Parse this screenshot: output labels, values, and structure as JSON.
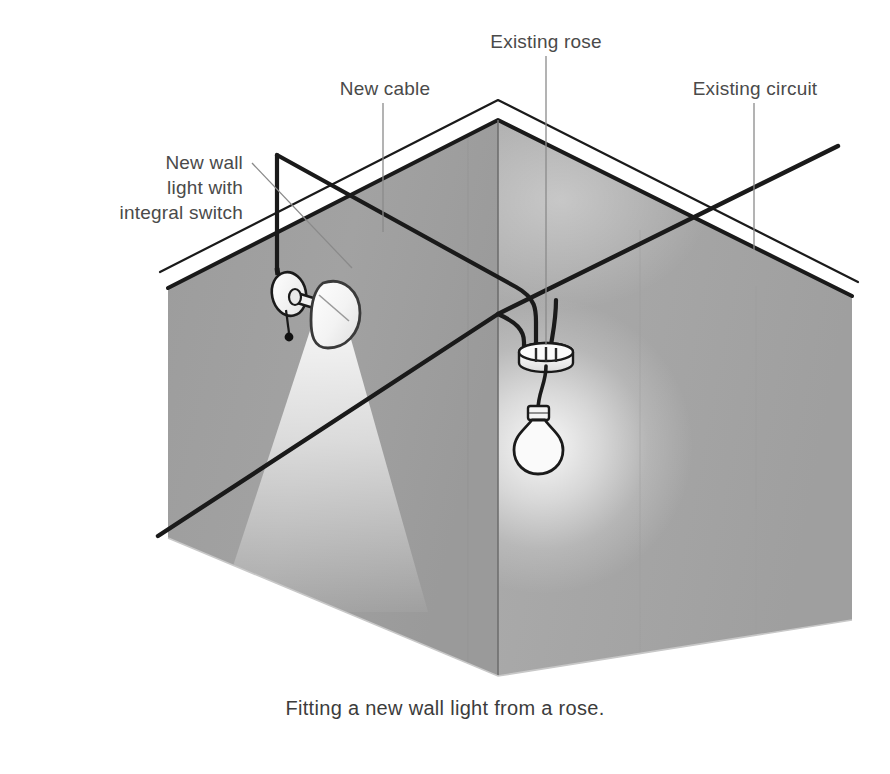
{
  "figure": {
    "caption": "Fitting a new wall light from a rose.",
    "background_color": "#ffffff",
    "label_color": "#4a4a4a",
    "cable_color": "#1a1a1a",
    "leader_color": "#8a8a8a",
    "wall_left_color": "#9e9e9e",
    "wall_right_color": "#a8a8a8",
    "ceiling_color": "#ffffff",
    "floor_color": "#ffffff",
    "outline_color": "#1a1a1a",
    "fixture_fill": "#f2f2f2",
    "glow_color": "#ffffff"
  },
  "labels": [
    {
      "id": "new-wall-light",
      "text": "New wall\nlight with\nintegral switch",
      "align": "right",
      "x": 38,
      "y": 150,
      "width": 205
    },
    {
      "id": "new-cable",
      "text": "New cable",
      "align": "center",
      "x": 305,
      "y": 76,
      "width": 160
    },
    {
      "id": "existing-rose",
      "text": "Existing rose",
      "align": "center",
      "x": 478,
      "y": 29,
      "width": 180
    },
    {
      "id": "existing-circuit",
      "text": "Existing circuit",
      "align": "center",
      "x": 680,
      "y": 76,
      "width": 190
    }
  ],
  "annotations": {
    "leaders": [
      {
        "id": "leader-new-wall-light",
        "x1": 252,
        "y1": 163,
        "x2": 352,
        "y2": 268
      },
      {
        "id": "leader-new-cable",
        "x1": 383,
        "y1": 103,
        "x2": 383,
        "y2": 232
      },
      {
        "id": "leader-existing-rose",
        "x1": 546,
        "y1": 56,
        "x2": 546,
        "y2": 345
      },
      {
        "id": "leader-existing-circuit",
        "x1": 754,
        "y1": 103,
        "x2": 754,
        "y2": 250
      }
    ]
  },
  "components": {
    "wall_light": {
      "name": "New wall light with integral switch",
      "base_center_x": 289,
      "base_center_y": 292,
      "shade_center_x": 327,
      "shade_center_y": 302,
      "pull_cord_end_x": 289,
      "pull_cord_end_y": 337
    },
    "ceiling_rose": {
      "name": "Existing rose",
      "center_x": 546,
      "center_y": 357,
      "radius_x": 27,
      "radius_y": 9
    },
    "pendant_bulb": {
      "name": "Pendant lamp bulb",
      "center_x": 538,
      "center_y": 440,
      "flex_top_y": 366,
      "flex_bottom_y": 408
    }
  },
  "cables": {
    "new_cable": {
      "label": "New cable",
      "style": "solid",
      "description": "Runs up wall, along ceiling to rose"
    },
    "concealed_cable": {
      "label": "Concealed drop to wall light",
      "style": "dotted"
    },
    "existing_circuit": {
      "label": "Existing circuit",
      "style": "solid"
    }
  }
}
